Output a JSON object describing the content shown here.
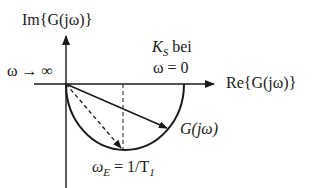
{
  "diagram": {
    "type": "nyquist-plot",
    "colors": {
      "stroke": "#1a1a1a",
      "background": "#ffffff"
    },
    "axes": {
      "imag_label": "Im{G(jω)}",
      "real_label": "Re{G(jω)}"
    },
    "annotations": {
      "omega_inf": "ω → ∞",
      "ks_line1": "K",
      "ks_sub": "S",
      "ks_bei": " bei",
      "omega_zero": "ω = 0",
      "g_label": "G(jω)",
      "omega_e_main": "ω",
      "omega_e_sub": "E",
      "omega_e_eq": " = 1/T",
      "omega_e_t_sub": "1"
    },
    "curve": {
      "shape": "lower semicircle",
      "start": "origin (ω → ∞)",
      "end": "K_S on real axis (ω = 0)",
      "lowest_point": "ω_E = 1/T_1"
    },
    "vectors": [
      {
        "name": "G(jω)",
        "style": "solid"
      },
      {
        "name": "G(jω_E)",
        "style": "dashed"
      }
    ]
  }
}
